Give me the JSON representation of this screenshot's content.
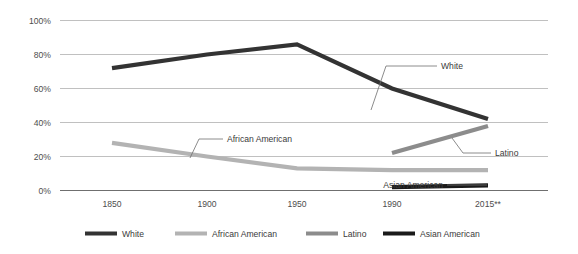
{
  "chart_data": {
    "type": "line",
    "title": "",
    "xlabel": "",
    "ylabel": "",
    "x": [
      "1850",
      "1900",
      "1950",
      "1990",
      "2015**"
    ],
    "x_tick_labels": [
      "1850",
      "1900",
      "1950",
      "1990",
      "2015**"
    ],
    "y_tick_labels": [
      "100%",
      "80%",
      "60%",
      "40%",
      "20%",
      "0%"
    ],
    "ylim": [
      0,
      100
    ],
    "y_ticks": [
      0,
      20,
      40,
      60,
      80,
      100
    ],
    "grid": "horizontal",
    "legend_position": "bottom",
    "series": [
      {
        "name": "White",
        "color": "#333333",
        "x": [
          "1850",
          "1900",
          "1950",
          "1990",
          "2015**"
        ],
        "values": [
          72,
          80,
          86,
          60,
          42
        ]
      },
      {
        "name": "African American",
        "color": "#b3b3b3",
        "x": [
          "1850",
          "1900",
          "1950",
          "1990",
          "2015**"
        ],
        "values": [
          28,
          20,
          13,
          12,
          12
        ]
      },
      {
        "name": "Latino",
        "color": "#8c8c8c",
        "x": [
          "1990",
          "2015**"
        ],
        "values": [
          22,
          38
        ]
      },
      {
        "name": "Asian American",
        "color": "#1a1a1a",
        "x": [
          "1990",
          "2015**"
        ],
        "values": [
          2,
          3
        ]
      }
    ],
    "annotations": [
      {
        "label": "White",
        "series": "White"
      },
      {
        "label": "African American",
        "series": "African American"
      },
      {
        "label": "Latino",
        "series": "Latino"
      },
      {
        "label": "Asian American",
        "series": "Asian American"
      }
    ],
    "legend": [
      {
        "label": "White",
        "color": "#333333"
      },
      {
        "label": "African American",
        "color": "#b3b3b3"
      },
      {
        "label": "Latino",
        "color": "#8c8c8c"
      },
      {
        "label": "Asian American",
        "color": "#1a1a1a"
      }
    ]
  },
  "axis": {
    "y_labels": {
      "t100": "100%",
      "t80": "80%",
      "t60": "60%",
      "t40": "40%",
      "t20": "20%",
      "t0": "0%"
    },
    "x_labels": {
      "x1": "1850",
      "x2": "1900",
      "x3": "1950",
      "x4": "1990",
      "x5": "2015**"
    }
  },
  "annotations": {
    "white": "White",
    "african_american": "African American",
    "latino": "Latino",
    "asian_american": "Asian American"
  },
  "legend": {
    "item1": "White",
    "item2": "African American",
    "item3": "Latino",
    "item4": "Asian American"
  }
}
